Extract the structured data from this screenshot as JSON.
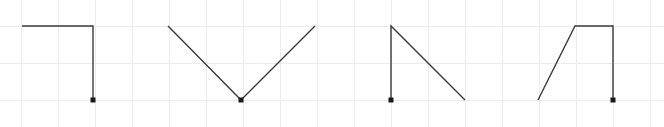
{
  "canvas": {
    "width": 664,
    "height": 127,
    "background_color": "#ffffff",
    "title": "stroke-path-diagram"
  },
  "grid": {
    "visible": true,
    "line_color": "#ececec",
    "line_width": 1,
    "spacing_x": 37,
    "spacing_y": 37,
    "origin_x": 21,
    "origin_y": 26,
    "vertical_lines": [
      21,
      58,
      95,
      132,
      169,
      206,
      243,
      280,
      317,
      354,
      391,
      428,
      465,
      502,
      539,
      576,
      613,
      650
    ],
    "horizontal_lines": [
      26,
      63,
      100
    ]
  },
  "style": {
    "stroke_color": "#3a3a3a",
    "stroke_width": 1.4,
    "endpoint_marker_color": "#1a1a1a",
    "endpoint_marker_size": 5
  },
  "chart_data": {
    "type": "line",
    "xlabel": "",
    "ylabel": "",
    "xlim": [
      0,
      664
    ],
    "ylim": [
      127,
      0
    ],
    "grid": true,
    "legend": "none",
    "series": [
      {
        "name": "shape-1-corner-down",
        "label": "Horizontal then vertical drop",
        "points": [
          [
            22,
            26
          ],
          [
            93,
            26
          ],
          [
            93,
            100
          ]
        ],
        "endpoint_marker_at": [
          93,
          100
        ]
      },
      {
        "name": "shape-2-vee",
        "label": "V shape",
        "points": [
          [
            168,
            26
          ],
          [
            241,
            100
          ],
          [
            315,
            26
          ]
        ],
        "endpoint_marker_at": [
          241,
          100
        ]
      },
      {
        "name": "shape-3-vertical-then-diagonal",
        "label": "Vertical drop then diagonal down-right",
        "points": [
          [
            391,
            100
          ],
          [
            391,
            26
          ],
          [
            465,
            100
          ]
        ],
        "endpoint_marker_at": [
          391,
          100
        ]
      },
      {
        "name": "shape-4-ramp-plateau-drop",
        "label": "Diagonal rise, plateau, vertical drop",
        "points": [
          [
            538,
            100
          ],
          [
            575,
            26
          ],
          [
            613,
            26
          ],
          [
            613,
            100
          ]
        ],
        "endpoint_marker_at": [
          613,
          100
        ]
      }
    ]
  }
}
